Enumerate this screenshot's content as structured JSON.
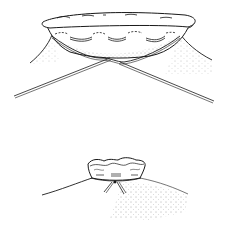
{
  "figure": {
    "panels": [
      {
        "id": "top",
        "description": "Stoma edge with purse-string suture, two suture ends crossing below"
      },
      {
        "id": "bottom",
        "description": "Suture tied, stoma gathered on skin mound"
      }
    ],
    "colors": {
      "ink": "#1a1a1a",
      "background": "#ffffff",
      "stipple": "#555555"
    }
  }
}
